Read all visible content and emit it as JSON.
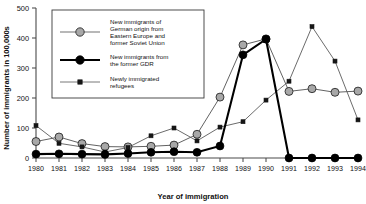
{
  "chart_data": {
    "type": "line",
    "title": "",
    "xlabel": "Year of immigration",
    "ylabel": "Number of immigrants in 100,000s",
    "x": [
      1980,
      1981,
      1982,
      1983,
      1984,
      1985,
      1986,
      1987,
      1988,
      1989,
      1990,
      1991,
      1992,
      1993,
      1994
    ],
    "xtick_labels": [
      "1980",
      "1981",
      "1982",
      "1983",
      "1984",
      "1985",
      "1986",
      "1987",
      "1988",
      "1989",
      "1990",
      "1991",
      "1992",
      "1993",
      "1994"
    ],
    "ytick_labels": [
      "0",
      "100",
      "200",
      "300",
      "400",
      "500"
    ],
    "yticks": [
      0,
      100,
      200,
      300,
      400,
      500
    ],
    "ylim": [
      0,
      500
    ],
    "xlim": [
      1980,
      1994
    ],
    "grid": false,
    "legend_position": "upper-left-inset",
    "series": [
      {
        "name": "New immigrants of German origin from Eastern Europe and former Soviet Union",
        "short_name": "german-origin-immigrants",
        "marker": "circle-grey",
        "color": "#a8a8a8",
        "values": [
          55,
          70,
          48,
          38,
          37,
          39,
          43,
          79,
          203,
          377,
          397,
          222,
          231,
          219,
          223
        ]
      },
      {
        "name": "New immigrants from the former GDR",
        "short_name": "former-gdr-immigrants",
        "marker": "circle-black",
        "color": "#000000",
        "values": [
          13,
          14,
          13,
          12,
          15,
          19,
          21,
          19,
          40,
          344,
          396,
          0,
          0,
          0,
          0
        ]
      },
      {
        "name": "Newly immigrated refugees",
        "short_name": "newly-immigrated-refugees",
        "marker": "square-black",
        "color": "#161616",
        "values": [
          108,
          49,
          37,
          20,
          35,
          74,
          100,
          57,
          103,
          121,
          193,
          256,
          438,
          323,
          127
        ]
      }
    ],
    "legend": [
      {
        "label_lines": [
          "New immigrants of",
          "German origin from",
          "Eastern Europe and",
          "former Soviet Union"
        ],
        "marker": "circle-grey"
      },
      {
        "label_lines": [
          "New immigrants from",
          "the former GDR"
        ],
        "marker": "circle-black"
      },
      {
        "label_lines": [
          "Newly immigrated",
          "refugees"
        ],
        "marker": "square-black"
      }
    ]
  }
}
